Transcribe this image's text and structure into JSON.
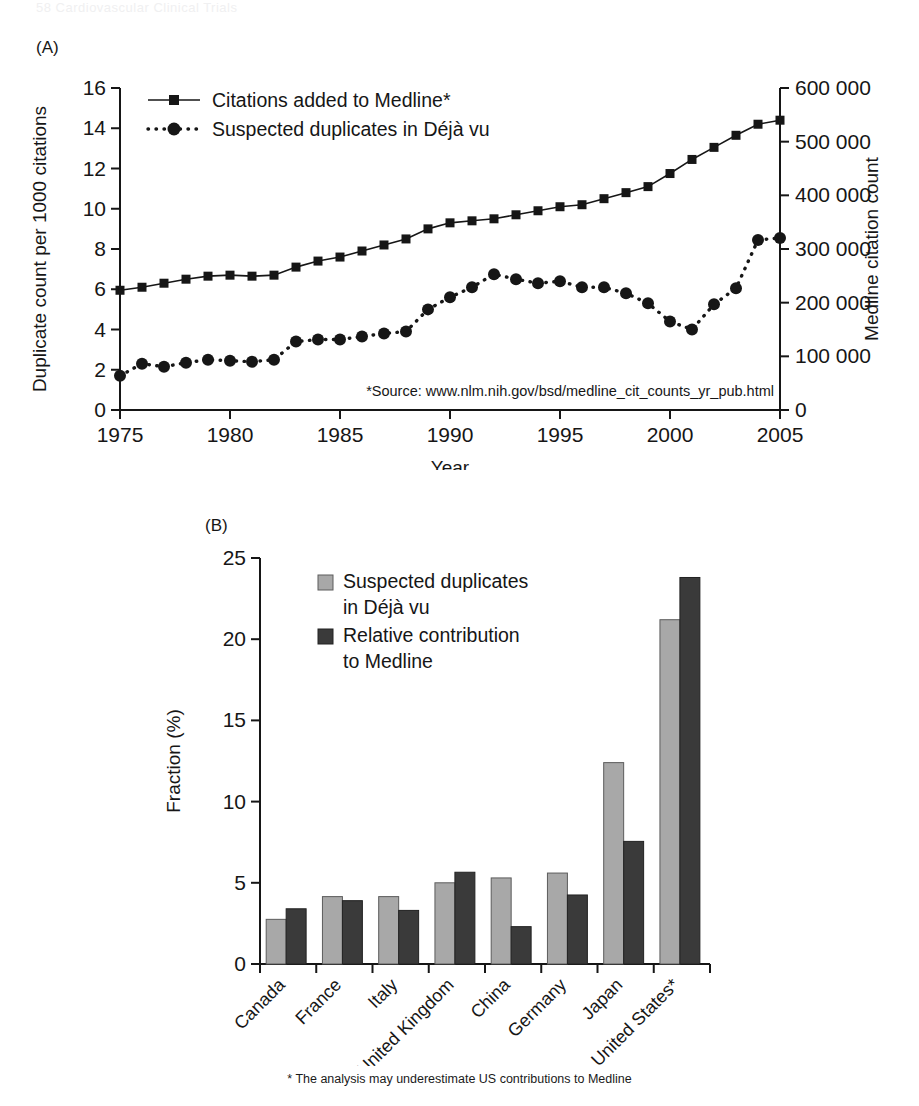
{
  "page": {
    "running_header": "58    Cardiovascular Clinical Trials",
    "footnote": "* The analysis may underestimate US contributions to Medline"
  },
  "panels": {
    "a_label": "(A)",
    "b_label": "(B)"
  },
  "chart_data": [
    {
      "type": "line",
      "panel": "(A)",
      "title": "",
      "xlabel": "Year",
      "ylabel": "Duplicate count per 1000 citations",
      "y2label": "Medline citation count",
      "xlim": [
        1975,
        2005
      ],
      "ylim": [
        0,
        16
      ],
      "y2lim": [
        0,
        600000
      ],
      "xticks": [
        1975,
        1980,
        1985,
        1990,
        1995,
        2000,
        2005
      ],
      "xticklabels": [
        "1975",
        "1980",
        "1985",
        "1990",
        "1995",
        "2000",
        "2005"
      ],
      "yticks": [
        0,
        2,
        4,
        6,
        8,
        10,
        12,
        14,
        16
      ],
      "yticklabels": [
        "0",
        "2",
        "4",
        "6",
        "8",
        "10",
        "12",
        "14",
        "16"
      ],
      "y2ticks": [
        0,
        100000,
        200000,
        300000,
        400000,
        500000,
        600000
      ],
      "y2ticklabels": [
        "0",
        "100 000",
        "200 000",
        "300 000",
        "400 000",
        "500 000",
        "600 000"
      ],
      "grid": false,
      "legend_position": "top-left",
      "annotation": "*Source: www.nlm.nih.gov/bsd/medline_cit_counts_yr_pub.html",
      "x": [
        1975,
        1976,
        1977,
        1978,
        1979,
        1980,
        1981,
        1982,
        1983,
        1984,
        1985,
        1986,
        1987,
        1988,
        1989,
        1990,
        1991,
        1992,
        1993,
        1994,
        1995,
        1996,
        1997,
        1998,
        1999,
        2000,
        2001,
        2002,
        2003,
        2004,
        2005
      ],
      "series": [
        {
          "name": "Citations added to Medline*",
          "marker": "square",
          "linestyle": "solid",
          "axis": "right",
          "values": [
            5.95,
            6.1,
            6.3,
            6.5,
            6.65,
            6.7,
            6.65,
            6.7,
            7.1,
            7.4,
            7.6,
            7.9,
            8.2,
            8.5,
            9.0,
            9.3,
            9.4,
            9.5,
            9.7,
            9.9,
            10.1,
            10.2,
            10.5,
            10.8,
            11.1,
            11.75,
            12.45,
            13.05,
            13.65,
            14.2,
            14.4
          ]
        },
        {
          "name": "Suspected duplicates in Déjà vu",
          "marker": "circle",
          "linestyle": "dotted",
          "axis": "left",
          "values": [
            1.7,
            2.3,
            2.15,
            2.35,
            2.5,
            2.45,
            2.4,
            2.5,
            3.4,
            3.5,
            3.5,
            3.65,
            3.8,
            3.9,
            5.0,
            5.6,
            6.1,
            6.75,
            6.5,
            6.3,
            6.4,
            6.1,
            6.1,
            5.8,
            5.3,
            4.4,
            4.0,
            5.25,
            6.05,
            8.45,
            8.55
          ]
        }
      ]
    },
    {
      "type": "bar",
      "panel": "(B)",
      "title": "",
      "xlabel": "",
      "ylabel": "Fraction (%)",
      "ylim": [
        0,
        25
      ],
      "yticks": [
        0,
        5,
        10,
        15,
        20,
        25
      ],
      "yticklabels": [
        "0",
        "5",
        "10",
        "15",
        "20",
        "25"
      ],
      "grid": false,
      "legend_position": "top-left",
      "categories": [
        "Canada",
        "France",
        "Italy",
        "United Kingdom",
        "China",
        "Germany",
        "Japan",
        "United States*"
      ],
      "series": [
        {
          "name": "Suspected duplicates in Déjà vu",
          "color": "#a8a8a8",
          "values": [
            2.75,
            4.15,
            4.15,
            5.0,
            5.3,
            5.6,
            12.4,
            21.2
          ]
        },
        {
          "name": "Relative contribution to Medline",
          "color": "#3a3a3a",
          "values": [
            3.4,
            3.9,
            3.3,
            5.65,
            2.3,
            4.25,
            7.55,
            23.8
          ]
        }
      ],
      "legend_lines": [
        [
          "Suspected duplicates",
          "in Déjà vu"
        ],
        [
          "Relative contribution",
          "to Medline"
        ]
      ]
    }
  ]
}
